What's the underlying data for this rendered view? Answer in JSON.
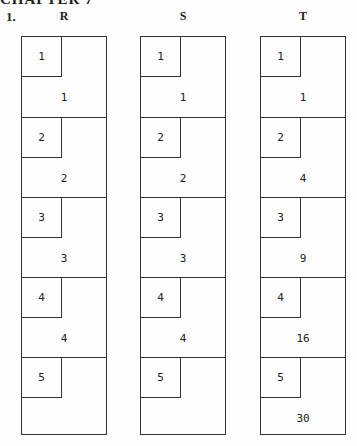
{
  "heading": "CHAPTER 7",
  "question_number": "1.",
  "columns": [
    {
      "label": "R",
      "rows": [
        {
          "index": "1",
          "value": "1"
        },
        {
          "index": "2",
          "value": "2"
        },
        {
          "index": "3",
          "value": "3"
        },
        {
          "index": "4",
          "value": "4"
        },
        {
          "index": "5",
          "value": ""
        }
      ]
    },
    {
      "label": "S",
      "rows": [
        {
          "index": "1",
          "value": "1"
        },
        {
          "index": "2",
          "value": "2"
        },
        {
          "index": "3",
          "value": "3"
        },
        {
          "index": "4",
          "value": "4"
        },
        {
          "index": "5",
          "value": ""
        }
      ]
    },
    {
      "label": "T",
      "rows": [
        {
          "index": "1",
          "value": "1"
        },
        {
          "index": "2",
          "value": "4"
        },
        {
          "index": "3",
          "value": "9"
        },
        {
          "index": "4",
          "value": "16"
        },
        {
          "index": "5",
          "value": "30"
        }
      ]
    }
  ]
}
